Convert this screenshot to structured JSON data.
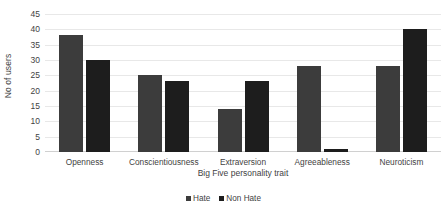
{
  "chart_data": {
    "type": "bar",
    "title": "",
    "xlabel": "Big Five personality trait",
    "ylabel": "No of users",
    "categories": [
      "Openness",
      "Conscientiousness",
      "Extraversion",
      "Agreeableness",
      "Neuroticism"
    ],
    "series": [
      {
        "name": "Hate",
        "color": "#3c3c3c",
        "values": [
          38,
          25,
          14,
          28,
          28
        ]
      },
      {
        "name": "Non Hate",
        "color": "#1d1d1d",
        "values": [
          30,
          23,
          23,
          1,
          40
        ]
      }
    ],
    "ylim": [
      0,
      45
    ],
    "ytick_step": 5,
    "yticks": [
      0,
      5,
      10,
      15,
      20,
      25,
      30,
      35,
      40,
      45
    ],
    "grid": true,
    "legend_position": "bottom"
  }
}
